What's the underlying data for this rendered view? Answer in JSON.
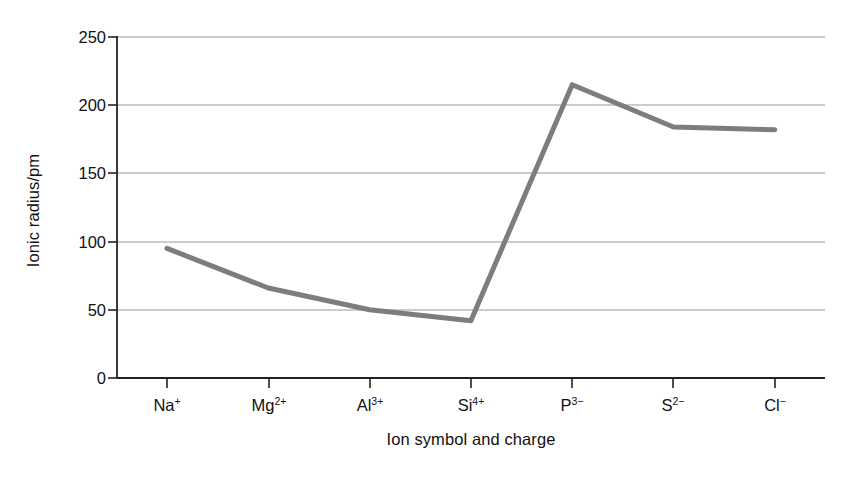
{
  "chart_data": {
    "type": "line",
    "title": "",
    "xlabel": "Ion symbol and charge",
    "ylabel": "Ionic radius/pm",
    "categories": [
      "Na+",
      "Mg2+",
      "Al3+",
      "Si4+",
      "P3-",
      "S2-",
      "Cl-"
    ],
    "category_labels": [
      {
        "symbol": "Na",
        "charge": "+"
      },
      {
        "symbol": "Mg",
        "charge": "2+"
      },
      {
        "symbol": "Al",
        "charge": "3+"
      },
      {
        "symbol": "Si",
        "charge": "4+"
      },
      {
        "symbol": "P",
        "charge": "3−"
      },
      {
        "symbol": "S",
        "charge": "2−"
      },
      {
        "symbol": "Cl",
        "charge": "−"
      }
    ],
    "values": [
      95,
      66,
      50,
      42,
      215,
      184,
      182
    ],
    "ylim": [
      0,
      250
    ],
    "yticks": [
      0,
      50,
      100,
      150,
      200,
      250
    ],
    "ytick_labels": [
      "0",
      "50",
      "100",
      "150",
      "200",
      "250"
    ],
    "grid": true,
    "legend": "none",
    "series": [
      {
        "name": "Ionic radius",
        "values": [
          95,
          66,
          50,
          42,
          215,
          184,
          182
        ],
        "color": "#7d7d7d"
      }
    ]
  },
  "style": {
    "line_color": "#7d7d7d",
    "axis_color": "#222222",
    "grid_color": "#9a9a9a",
    "background": "#ffffff"
  }
}
